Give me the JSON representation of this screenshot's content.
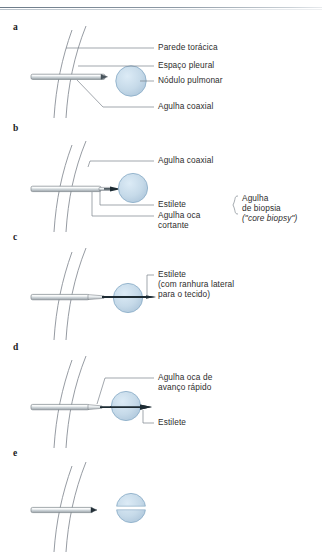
{
  "figure": {
    "title_visible": false,
    "background_color": "#ffffff",
    "nodule_color": "#c2d7e8",
    "nodule_stroke": "#8fb0c9",
    "needle_body_color": "#d8dde0",
    "needle_outline_color": "#7d858b",
    "stylet_dark_color": "#1d2b33",
    "chest_line_color": "#8a9097",
    "leader_line_color": "#7a8189",
    "rule_color": "#7b8892"
  },
  "panels": [
    {
      "id": "a",
      "letter": "a",
      "labels": [
        {
          "name": "parede-toracica",
          "text": "Parede torácica",
          "italic": false
        },
        {
          "name": "espaco-pleural",
          "text": "Espaço pleural",
          "italic": false
        },
        {
          "name": "nodulo-pulmonar",
          "text": "Nódulo pulmonar",
          "italic": false
        },
        {
          "name": "agulha-coaxial",
          "text": "Agulha coaxial",
          "italic": false
        }
      ]
    },
    {
      "id": "b",
      "letter": "b",
      "labels": [
        {
          "name": "agulha-coaxial",
          "text": "Agulha coaxial",
          "italic": false
        },
        {
          "name": "estilete",
          "text": "Estilete",
          "italic": false
        },
        {
          "name": "agulha-oca-cortante-l1",
          "text": "Agulha oca",
          "italic": false
        },
        {
          "name": "agulha-oca-cortante-l2",
          "text": "cortante",
          "italic": false
        }
      ],
      "bracket_label": [
        {
          "name": "agulha-biopsia-l1",
          "text": "Agulha",
          "italic": false
        },
        {
          "name": "agulha-biopsia-l2",
          "text": "de biopsia",
          "italic": false
        },
        {
          "name": "agulha-biopsia-l3",
          "text": "(\"core biopsy\")",
          "italic": true
        }
      ]
    },
    {
      "id": "c",
      "letter": "c",
      "labels": [
        {
          "name": "estilete-l1",
          "text": "Estilete",
          "italic": false
        },
        {
          "name": "estilete-l2",
          "text": "(com ranhura lateral",
          "italic": false
        },
        {
          "name": "estilete-l3",
          "text": "para o tecido)",
          "italic": false
        }
      ]
    },
    {
      "id": "d",
      "letter": "d",
      "labels": [
        {
          "name": "agulha-oca-avanco-l1",
          "text": "Agulha oca de",
          "italic": false
        },
        {
          "name": "agulha-oca-avanco-l2",
          "text": "avanço rápido",
          "italic": false
        },
        {
          "name": "estilete",
          "text": "Estilete",
          "italic": false
        }
      ]
    },
    {
      "id": "e",
      "letter": "e",
      "labels": []
    }
  ],
  "text": {
    "a_letter": "a",
    "b_letter": "b",
    "c_letter": "c",
    "d_letter": "d",
    "e_letter": "e",
    "a_l1": "Parede torácica",
    "a_l2": "Espaço pleural",
    "a_l3": "Nódulo pulmonar",
    "a_l4": "Agulha coaxial",
    "b_l1": "Agulha coaxial",
    "b_l2": "Estilete",
    "b_l3a": "Agulha oca",
    "b_l3b": "cortante",
    "b_br1": "Agulha",
    "b_br2": "de biopsia",
    "b_br3": "(\"core biopsy\")",
    "c_l1": "Estilete",
    "c_l2": "(com ranhura lateral",
    "c_l3": "para o tecido)",
    "d_l1": "Agulha oca de",
    "d_l2": "avanço rápido",
    "d_l3": "Estilete"
  }
}
